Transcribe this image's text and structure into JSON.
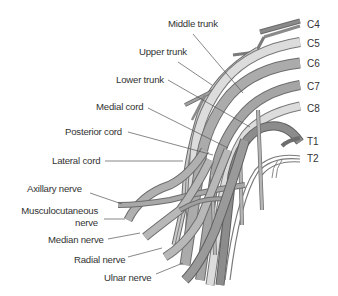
{
  "figure": {
    "colors": {
      "light_nerve": "#d6d6d6",
      "mid_nerve": "#a9a9a9",
      "dark_nerve": "#7f7f7f",
      "outline": "#6a6a6a",
      "leader": "#555555",
      "text": "#333333"
    }
  },
  "roots": [
    {
      "id": "c4",
      "label": "C4"
    },
    {
      "id": "c5",
      "label": "C5"
    },
    {
      "id": "c6",
      "label": "C6"
    },
    {
      "id": "c7",
      "label": "C7"
    },
    {
      "id": "c8",
      "label": "C8"
    },
    {
      "id": "t1",
      "label": "T1"
    },
    {
      "id": "t2",
      "label": "T2"
    }
  ],
  "labels": [
    {
      "id": "middle-trunk",
      "text": "Middle trunk"
    },
    {
      "id": "upper-trunk",
      "text": "Upper trunk"
    },
    {
      "id": "lower-trunk",
      "text": "Lower trunk"
    },
    {
      "id": "medial-cord",
      "text": "Medial cord"
    },
    {
      "id": "posterior-cord",
      "text": "Posterior cord"
    },
    {
      "id": "lateral-cord",
      "text": "Lateral cord"
    },
    {
      "id": "axillary-nerve",
      "text": "Axillary nerve"
    },
    {
      "id": "musculocutaneous-nerve-1",
      "text": "Musculocutaneous"
    },
    {
      "id": "musculocutaneous-nerve-2",
      "text": "nerve"
    },
    {
      "id": "median-nerve",
      "text": "Median nerve"
    },
    {
      "id": "radial-nerve",
      "text": "Radial nerve"
    },
    {
      "id": "ulnar-nerve",
      "text": "Ulnar nerve"
    }
  ]
}
